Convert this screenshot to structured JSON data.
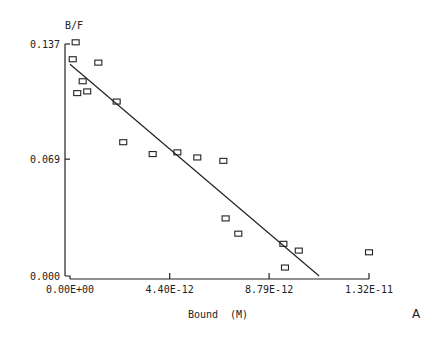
{
  "chart_data": {
    "type": "scatter",
    "title": "",
    "xlabel": "Bound  (M)",
    "ylabel": "B/F",
    "panel_label": "A",
    "xlim": [
      0,
      1.32e-11
    ],
    "ylim": [
      0,
      0.137
    ],
    "x_ticks": [
      0,
      4.4e-12,
      8.79e-12,
      1.32e-11
    ],
    "x_tick_labels": [
      "0.00E+00",
      "4.40E-12",
      "8.79E-12",
      "1.32E-11"
    ],
    "y_ticks": [
      0,
      0.069,
      0.137
    ],
    "y_tick_labels": [
      "0.000",
      "0.069",
      "0.137"
    ],
    "grid": false,
    "legend": null,
    "series": [
      {
        "name": "data",
        "marker": "open-square",
        "points": [
          {
            "x": 2.5e-13,
            "y": 0.138
          },
          {
            "x": 1.2e-13,
            "y": 0.128
          },
          {
            "x": 1.25e-12,
            "y": 0.126
          },
          {
            "x": 5.6e-13,
            "y": 0.115
          },
          {
            "x": 3.2e-13,
            "y": 0.108
          },
          {
            "x": 7.6e-13,
            "y": 0.109
          },
          {
            "x": 2.06e-12,
            "y": 0.103
          },
          {
            "x": 2.35e-12,
            "y": 0.079
          },
          {
            "x": 3.65e-12,
            "y": 0.072
          },
          {
            "x": 4.74e-12,
            "y": 0.073
          },
          {
            "x": 5.62e-12,
            "y": 0.07
          },
          {
            "x": 6.77e-12,
            "y": 0.068
          },
          {
            "x": 6.87e-12,
            "y": 0.034
          },
          {
            "x": 7.43e-12,
            "y": 0.025
          },
          {
            "x": 9.42e-12,
            "y": 0.019
          },
          {
            "x": 9.49e-12,
            "y": 0.005
          },
          {
            "x": 1.01e-11,
            "y": 0.015
          },
          {
            "x": 1.32e-11,
            "y": 0.014
          }
        ]
      },
      {
        "name": "linear fit",
        "type": "line",
        "points": [
          {
            "x": 0,
            "y": 0.125
          },
          {
            "x": 1.1e-11,
            "y": 0.0
          }
        ]
      }
    ]
  },
  "colors": {
    "ink": "#222222",
    "background": "#ffffff"
  }
}
